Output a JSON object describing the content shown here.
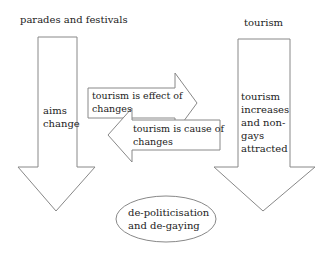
{
  "diagram": {
    "left_column": {
      "title": "parades and festivals",
      "arrow_text_lines": [
        "aims",
        "change"
      ]
    },
    "right_column": {
      "title": "tourism",
      "arrow_text_lines": [
        "tourism",
        "increases",
        "and non-",
        "gays",
        "attracted"
      ]
    },
    "effect_arrow": {
      "text_lines": [
        "tourism is effect of",
        "changes"
      ],
      "direction": "right"
    },
    "cause_arrow": {
      "text_lines": [
        "tourism  is cause of",
        "changes"
      ],
      "direction": "left"
    },
    "outcome": {
      "text_lines": [
        "de-politicisation",
        "and de-gaying"
      ],
      "shape": "ellipse"
    },
    "colors": {
      "stroke": "#888888",
      "fill": "#ffffff",
      "text": "#222222"
    }
  }
}
